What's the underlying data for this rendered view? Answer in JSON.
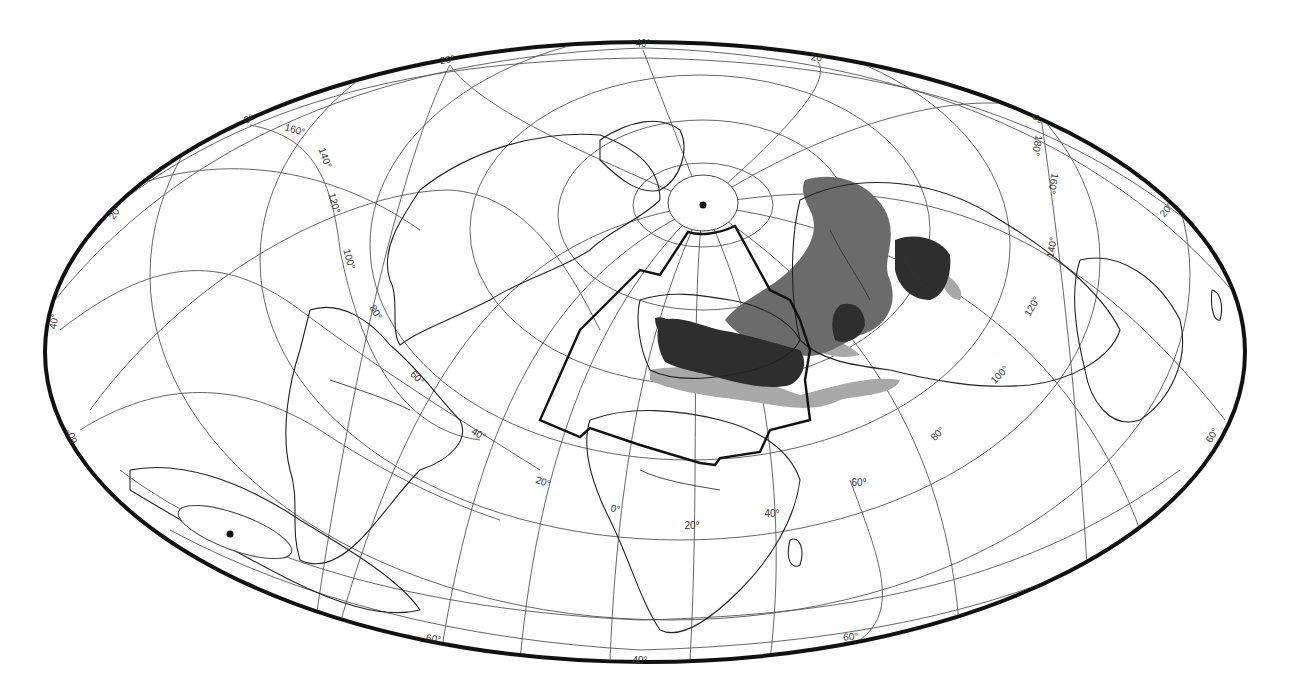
{
  "map": {
    "projection": "oblique equal-area ellipse world map",
    "colors": {
      "frame": "#111111",
      "graticule": "#555555",
      "coast": "#222222",
      "range_dark": "#2e2e2e",
      "range_medium": "#6b6b6b",
      "range_light": "#a8a8a8",
      "boundary": "#111111"
    },
    "graticule_labels": [
      {
        "text": "40°",
        "x": 643,
        "y": 47,
        "rot": 0
      },
      {
        "text": "20°",
        "x": 448,
        "y": 63,
        "rot": -10
      },
      {
        "text": "20°",
        "x": 818,
        "y": 61,
        "rot": 8
      },
      {
        "text": "0°",
        "x": 250,
        "y": 122,
        "rot": -25
      },
      {
        "text": "160°",
        "x": 294,
        "y": 133,
        "rot": 15
      },
      {
        "text": "140°",
        "x": 322,
        "y": 159,
        "rot": 70
      },
      {
        "text": "120°",
        "x": 331,
        "y": 204,
        "rot": 75
      },
      {
        "text": "100°",
        "x": 346,
        "y": 260,
        "rot": 75
      },
      {
        "text": "80°",
        "x": 373,
        "y": 314,
        "rot": 60
      },
      {
        "text": "60°",
        "x": 415,
        "y": 380,
        "rot": 45
      },
      {
        "text": "40°",
        "x": 477,
        "y": 437,
        "rot": 30
      },
      {
        "text": "20°",
        "x": 542,
        "y": 485,
        "rot": 20
      },
      {
        "text": "0°",
        "x": 615,
        "y": 512,
        "rot": 10
      },
      {
        "text": "20°",
        "x": 692,
        "y": 529,
        "rot": 0
      },
      {
        "text": "40°",
        "x": 772,
        "y": 517,
        "rot": 0
      },
      {
        "text": "60°",
        "x": 859,
        "y": 486,
        "rot": 0
      },
      {
        "text": "60°",
        "x": 851,
        "y": 640,
        "rot": -5
      },
      {
        "text": "40°",
        "x": 640,
        "y": 664,
        "rot": 0
      },
      {
        "text": "60°",
        "x": 433,
        "y": 642,
        "rot": 10
      },
      {
        "text": "20°",
        "x": 118,
        "y": 214,
        "rot": -55
      },
      {
        "text": "40°",
        "x": 57,
        "y": 322,
        "rot": -80
      },
      {
        "text": "60°",
        "x": 75,
        "y": 435,
        "rot": -110
      },
      {
        "text": "0°",
        "x": 1033,
        "y": 120,
        "rot": 80
      },
      {
        "text": "180°",
        "x": 1034,
        "y": 145,
        "rot": 100
      },
      {
        "text": "160°",
        "x": 1050,
        "y": 183,
        "rot": 100
      },
      {
        "text": "140°",
        "x": 1055,
        "y": 248,
        "rot": -80
      },
      {
        "text": "120°",
        "x": 1035,
        "y": 308,
        "rot": -60
      },
      {
        "text": "100°",
        "x": 1002,
        "y": 377,
        "rot": -45
      },
      {
        "text": "80°",
        "x": 940,
        "y": 436,
        "rot": -45
      },
      {
        "text": "20°",
        "x": 1169,
        "y": 212,
        "rot": -50
      },
      {
        "text": "60°",
        "x": 1215,
        "y": 437,
        "rot": -60
      }
    ],
    "poles": [
      {
        "name": "north-pole",
        "x": 703,
        "y": 205
      },
      {
        "name": "south-pole",
        "x": 230,
        "y": 534
      }
    ]
  }
}
